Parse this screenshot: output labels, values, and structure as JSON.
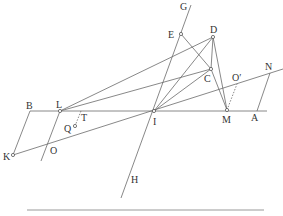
{
  "diagram": {
    "type": "geometric-construction",
    "points": {
      "G": {
        "label": "G",
        "x": 191,
        "y": 5,
        "lx": 180,
        "ly": 10
      },
      "E": {
        "label": "E",
        "x": 181,
        "y": 34,
        "lx": 168,
        "ly": 38
      },
      "D": {
        "label": "D",
        "x": 213,
        "y": 37,
        "lx": 210,
        "ly": 33
      },
      "C": {
        "label": "C",
        "x": 211,
        "y": 69,
        "lx": 204,
        "ly": 82
      },
      "O_prime": {
        "label": "O′",
        "x": 237,
        "y": 84,
        "lx": 232,
        "ly": 81
      },
      "N": {
        "label": "N",
        "x": 270,
        "y": 73,
        "lx": 265,
        "ly": 70
      },
      "I": {
        "label": "I",
        "x": 154,
        "y": 111,
        "lx": 153,
        "ly": 125
      },
      "M": {
        "label": "M",
        "x": 227,
        "y": 110,
        "lx": 222,
        "ly": 123
      },
      "A": {
        "label": "A",
        "x": 256,
        "y": 111,
        "lx": 251,
        "ly": 121
      },
      "B": {
        "label": "B",
        "x": 30,
        "y": 111,
        "lx": 26,
        "ly": 109
      },
      "L": {
        "label": "L",
        "x": 60,
        "y": 111,
        "lx": 56,
        "ly": 108
      },
      "T": {
        "label": "T",
        "x": 81,
        "y": 111,
        "lx": 81,
        "ly": 121
      },
      "Q": {
        "label": "Q",
        "x": 75,
        "y": 126,
        "lx": 64,
        "ly": 132
      },
      "O": {
        "label": "O",
        "x": 48,
        "y": 143,
        "lx": 50,
        "ly": 154
      },
      "K": {
        "label": "K",
        "x": 13,
        "y": 155,
        "lx": 3,
        "ly": 160
      },
      "H": {
        "label": "H",
        "x": 121,
        "y": 198,
        "lx": 131,
        "ly": 183
      }
    }
  }
}
